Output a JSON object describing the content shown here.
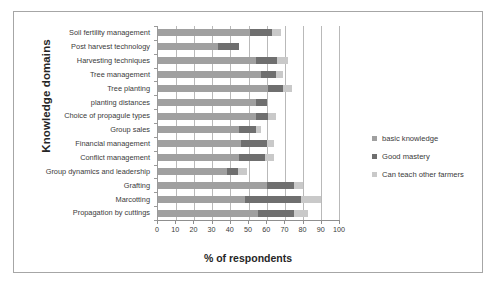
{
  "chart_data": {
    "type": "bar",
    "orientation": "horizontal",
    "stacked": true,
    "title": "",
    "xlabel": "% of respondents",
    "ylabel": "Knowledge domains",
    "xlim": [
      0,
      100
    ],
    "xticks": [
      0,
      10,
      20,
      30,
      40,
      50,
      60,
      70,
      80,
      90,
      100
    ],
    "grid": true,
    "legend_position": "right",
    "categories": [
      "Soil fertility management",
      "Post harvest technology",
      "Harvesting techniques",
      "Tree management",
      "Tree planting",
      "planting distances",
      "Choice of propagule types",
      "Group sales",
      "Financial management",
      "Conflict management",
      "Group dynamics and leadership",
      "Grafting",
      "Marcotting",
      "Propagation by cuttings"
    ],
    "series": [
      {
        "name": "basic knowledge",
        "color": "#a0a0a0",
        "values": [
          51,
          33,
          54,
          57,
          61,
          54,
          54,
          45,
          46,
          45,
          38,
          60,
          48,
          55
        ]
      },
      {
        "name": "Good mastery",
        "color": "#6f6f6f",
        "values": [
          12,
          12,
          12,
          8,
          8,
          6,
          7,
          9,
          14,
          14,
          6,
          15,
          31,
          20
        ]
      },
      {
        "name": "Can  teach other farmers",
        "color": "#c9c9c9",
        "values": [
          5,
          0,
          6,
          4,
          5,
          0,
          4,
          3,
          4,
          5,
          5,
          5,
          11,
          8
        ]
      }
    ],
    "legend": [
      "basic knowledge",
      "Good mastery",
      "Can  teach other farmers"
    ]
  }
}
